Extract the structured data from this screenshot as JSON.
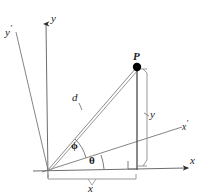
{
  "figure": {
    "type": "geometry-diagram",
    "background_color": "#ffffff",
    "line_color": "#6b6b6b",
    "dark_line_color": "#3c3c3c",
    "text_color": "#1a1a1a",
    "point_color": "#000000"
  },
  "labels": {
    "axis_y": "y",
    "axis_x": "x",
    "axis_y_prime": "y",
    "axis_y_prime_mark": "′",
    "axis_x_prime": "x",
    "axis_x_prime_mark": "′",
    "point_p": "P",
    "distance_d": "d",
    "component_y": "y",
    "component_x": "x",
    "angle_phi": "ϕ",
    "angle_theta": "θ"
  },
  "geometry": {
    "origin": {
      "x": 48,
      "y": 170
    },
    "point_p": {
      "x": 137,
      "y": 67
    },
    "y_axis_tip": {
      "x": 46,
      "y": 18
    },
    "x_axis_tip": {
      "x": 193,
      "y": 168
    },
    "y_prime_tip": {
      "x": 16,
      "y": 32
    },
    "x_prime_tip": {
      "x": 182,
      "y": 127
    },
    "foot_of_perpendicular": {
      "x": 137,
      "y": 169
    },
    "angle_phi_degrees": 49,
    "angle_theta_degrees": 14
  },
  "markers": {
    "right_angle": "right-angle-square",
    "point_marker": "filled-dot"
  }
}
